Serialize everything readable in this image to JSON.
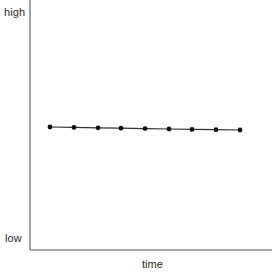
{
  "chart_data": {
    "type": "line",
    "title": "",
    "subtitle": "",
    "xlabel": "time",
    "ylabel": "",
    "y_axis_top_label": "high",
    "y_axis_bottom_label": "low",
    "grid": false,
    "legend": null,
    "legend_position": "none",
    "annotations": [],
    "xlim": [
      0,
      10
    ],
    "ylim": [
      0,
      10
    ],
    "x_tick_labels": [],
    "y_tick_labels": [
      "low",
      "high"
    ],
    "series": [
      {
        "name": "value",
        "marker": "filled-circle",
        "marker_color": "#111111",
        "line_color": "#333333",
        "line_width": 1.2,
        "x": [
          1,
          2,
          3,
          4,
          5,
          6,
          7,
          8,
          9
        ],
        "values": [
          5.1,
          5.08,
          5.06,
          5.04,
          5.02,
          5.0,
          4.98,
          4.96,
          4.94
        ]
      }
    ],
    "pixel_geometry": {
      "axis_color": "#8c8c8c",
      "axis_origin_x": 30,
      "axis_origin_y": 250,
      "y_axis_top_y": 0,
      "x_axis_right_x": 272,
      "point_pixels": [
        {
          "x": 50,
          "y": 127
        },
        {
          "x": 74,
          "y": 127.4
        },
        {
          "x": 98,
          "y": 127.8
        },
        {
          "x": 121,
          "y": 128.2
        },
        {
          "x": 145,
          "y": 128.6
        },
        {
          "x": 169,
          "y": 129.0
        },
        {
          "x": 192,
          "y": 129.4
        },
        {
          "x": 216,
          "y": 129.7
        },
        {
          "x": 240,
          "y": 130
        }
      ],
      "marker_radius": 2.4
    },
    "background_color": "#fefefe"
  }
}
